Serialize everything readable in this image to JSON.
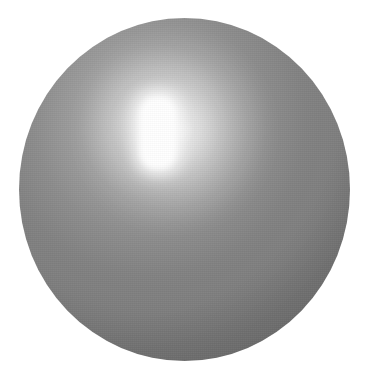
{
  "scene": {
    "title": "Gray sphere with specular highlight",
    "width": 378,
    "height": 383,
    "background_color": "#ffffff",
    "alt_text": "A large matte gray sphere centered on a plain white background, lit from the upper left by a soft rectangular light source"
  },
  "sphere": {
    "name": "gray-sphere",
    "shape": "sphere",
    "center_x": 184,
    "center_y": 190,
    "width": 331,
    "height": 343,
    "bounds": {
      "left": 19,
      "top": 18,
      "right": 350,
      "bottom": 361
    },
    "surface": "matte-glossy gray plastic",
    "colors": {
      "highlight_core": "#ffffff",
      "highlight_falloff": "#d8d8d8",
      "upper_left_light": "#b4b4b4",
      "midtone": "#7e7e7e",
      "left_limb": "#6e6e6e",
      "upper_right": "#6f6f6f",
      "shadow_lower_right": "#3a3a3a",
      "terminator_edge": "#393939"
    }
  },
  "lighting": {
    "source_type": "rectangular softbox reflection",
    "direction": "upper-left",
    "specular_highlight": {
      "name": "specular-highlight",
      "center_x": 158,
      "center_y": 133,
      "core_width": 44,
      "core_height": 82,
      "shape": "vertical rounded rectangle",
      "color": "#ffffff"
    },
    "secondary_glint": {
      "name": "secondary-glint",
      "center_x": 181,
      "center_y": 131,
      "diameter": 26,
      "intensity": "faint"
    },
    "shadow_side": "lower-right"
  },
  "texture": {
    "grain": "fine scan grain",
    "visible": true
  }
}
